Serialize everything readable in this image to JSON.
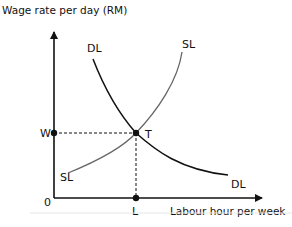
{
  "diagram": {
    "y_axis_label": "Wage rate per day (RM)",
    "x_axis_label": "Labour hour per week",
    "origin_label": "0",
    "wage_label": "W",
    "labour_label": "L",
    "equilibrium_label": "T",
    "demand_curve": {
      "label_top": "DL",
      "label_bottom": "DL",
      "color": "#111111"
    },
    "supply_curve": {
      "label_top": "SL",
      "label_bottom": "SL",
      "color": "#666666"
    },
    "axis_color": "#111111",
    "guide_line_style": "dashed"
  }
}
